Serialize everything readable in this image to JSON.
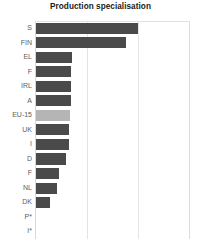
{
  "chart_data": {
    "type": "bar",
    "orientation": "horizontal",
    "title": "Production specialisation",
    "xlabel": "",
    "ylabel": "",
    "grid": true,
    "gridlines_x": [
      33.3,
      66.7
    ],
    "xlim": [
      0,
      100
    ],
    "legend": "none",
    "categories": [
      "S",
      "FIN",
      "EL",
      "F",
      "IRL",
      "A",
      "EU-15",
      "UK",
      "I",
      "D",
      "F",
      "NL",
      "DK",
      "P*",
      "I*"
    ],
    "values": [
      66.5,
      58.7,
      23.2,
      22.6,
      22.6,
      22.6,
      21.9,
      21.3,
      21.3,
      19.4,
      14.8,
      13.5,
      9.0,
      0.0,
      0.0
    ],
    "highlight_category": "EU-15",
    "colors": {
      "bar": "#4a4a4a",
      "bar_highlight": "#b5b5b5",
      "gridline": "#e4e4e4",
      "axis": "#d8d8d8",
      "title": "#1a1a1a",
      "tick_label": "#5d5d5d",
      "background": "#ffffff"
    }
  }
}
